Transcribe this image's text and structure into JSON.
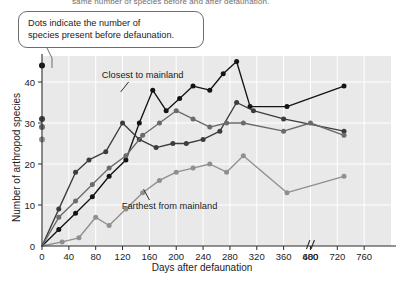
{
  "figure": {
    "clipped_top_caption": "same number of species before and after defaunation.",
    "callout_text_line1": "Dots indicate the number of",
    "callout_text_line2": "species present before defaunation."
  },
  "chart_data": {
    "type": "line",
    "title": "",
    "xlabel": "Days after defaunation",
    "ylabel": "Number of arthropod species",
    "xlim": [
      0,
      760
    ],
    "ylim": [
      0,
      46
    ],
    "grid": true,
    "axis_break_between": [
      400,
      680
    ],
    "xticks": [
      0,
      40,
      80,
      120,
      160,
      200,
      240,
      280,
      320,
      360,
      400,
      680,
      720,
      760
    ],
    "xtick_labels": [
      "0",
      "40",
      "80",
      "120",
      "160",
      "200",
      "240",
      "280",
      "320",
      "360",
      "400",
      "680",
      "720",
      "760"
    ],
    "yticks": [
      0,
      10,
      20,
      30,
      40
    ],
    "ytick_labels": [
      "0",
      "10",
      "20",
      "30",
      "40"
    ],
    "legend": "none",
    "annotations": [
      {
        "text": "Closest to mainland",
        "x": 430,
        "y": 41
      },
      {
        "text": "Farthest from mainland",
        "x": 470,
        "y": 9
      }
    ],
    "pre_defaunation_dots": [
      {
        "series": "Closest to mainland",
        "value": 44,
        "color": "#141414"
      },
      {
        "series": "Island 2",
        "value": 31,
        "color": "#3c3c3c"
      },
      {
        "series": "Island 3",
        "value": 29,
        "color": "#6b6b6b"
      },
      {
        "series": "Farthest from mainland",
        "value": 26,
        "color": "#8f8f8f"
      }
    ],
    "series": [
      {
        "name": "Closest to mainland",
        "color": "#141414",
        "x": [
          0,
          25,
          50,
          75,
          100,
          125,
          145,
          165,
          185,
          205,
          225,
          250,
          270,
          290,
          310,
          365,
          730
        ],
        "values": [
          0,
          4,
          8,
          12,
          17,
          21,
          30,
          38,
          33,
          36,
          39,
          38,
          42,
          45,
          34,
          34,
          39
        ]
      },
      {
        "name": "Island 2",
        "color": "#3c3c3c",
        "x": [
          0,
          25,
          50,
          70,
          95,
          120,
          145,
          170,
          195,
          215,
          240,
          265,
          290,
          315,
          360,
          730
        ],
        "values": [
          0,
          9,
          18,
          21,
          23,
          30,
          26,
          24,
          25,
          25,
          26,
          28,
          35,
          33,
          31,
          28
        ]
      },
      {
        "name": "Island 3",
        "color": "#6b6b6b",
        "x": [
          0,
          25,
          50,
          75,
          100,
          125,
          150,
          175,
          200,
          225,
          250,
          275,
          300,
          360,
          680,
          730
        ],
        "values": [
          0,
          7,
          11,
          15,
          19,
          22,
          27,
          30,
          33,
          31,
          29,
          30,
          30,
          28,
          30,
          27
        ]
      },
      {
        "name": "Farthest from mainland",
        "color": "#8f8f8f",
        "x": [
          0,
          30,
          55,
          80,
          100,
          125,
          150,
          175,
          200,
          225,
          250,
          275,
          300,
          365,
          730
        ],
        "values": [
          0,
          1,
          2,
          7,
          5,
          9,
          13,
          16,
          18,
          19,
          20,
          18,
          22,
          13,
          17
        ]
      }
    ]
  }
}
